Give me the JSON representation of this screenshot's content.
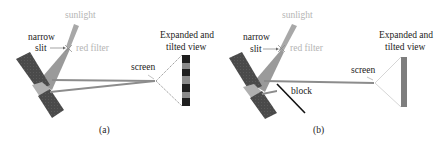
{
  "panels": [
    {
      "id": "a",
      "caption": "(a)",
      "labels": {
        "sunlight": "sunlight",
        "narrow": "narrow",
        "slit": "slit",
        "red_filter": "red filter",
        "screen": "screen",
        "expanded_line1": "Expanded and",
        "expanded_line2": "tilted view"
      },
      "screen_view": "striped fringes (alternating dark and gray bands)"
    },
    {
      "id": "b",
      "caption": "(b)",
      "labels": {
        "sunlight": "sunlight",
        "narrow": "narrow",
        "slit": "slit",
        "red_filter": "red filter",
        "screen": "screen",
        "expanded_line1": "Expanded and",
        "expanded_line2": "tilted view",
        "block": "block"
      },
      "screen_view": "uniform gray band (no fringes)"
    }
  ],
  "colors": {
    "mirror_dark": "#4a4a4a",
    "mirror_light": "#a8a8a8",
    "beam": "#8c8c8c",
    "light_text": "#b4b4b4",
    "dark_text": "#222222",
    "fringe_dark": "#1e1e1e",
    "fringe_gray": "#8a8a8a"
  }
}
